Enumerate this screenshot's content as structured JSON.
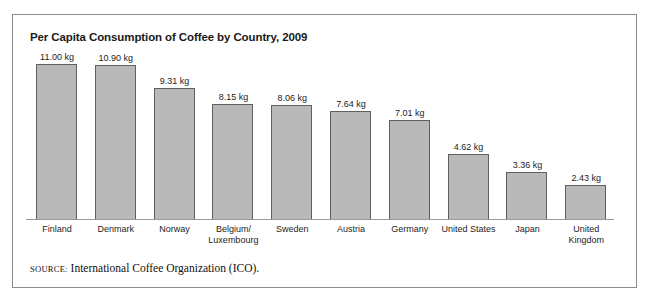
{
  "figure": {
    "title": "Per Capita Consumption of Coffee by Country, 2009",
    "source_label": "SOURCE:",
    "source_text": " International Coffee Organization (ICO).",
    "frame_color": "#8c8c8c",
    "bar_fill": "#b9b9b9",
    "bar_border": "#5f5f5f",
    "baseline_color": "#9a9a9a"
  },
  "chart_data": {
    "type": "bar",
    "title": "Per Capita Consumption of Coffee by Country, 2009",
    "xlabel": "",
    "ylabel": "",
    "unit": "kg",
    "ylim": [
      0,
      11.6
    ],
    "grid": false,
    "legend": false,
    "categories": [
      "Finland",
      "Denmark",
      "Norway",
      "Belgium/\nLuxembourg",
      "Sweden",
      "Austria",
      "Germany",
      "United States",
      "Japan",
      "United\nKingdom"
    ],
    "values": [
      11.0,
      10.9,
      9.31,
      8.15,
      8.06,
      7.64,
      7.01,
      4.62,
      3.36,
      2.43
    ],
    "value_labels": [
      "11.00 kg",
      "10.90 kg",
      "9.31 kg",
      "8.15 kg",
      "8.06 kg",
      "7.64 kg",
      "7.01 kg",
      "4.62 kg",
      "3.36 kg",
      "2.43 kg"
    ]
  }
}
